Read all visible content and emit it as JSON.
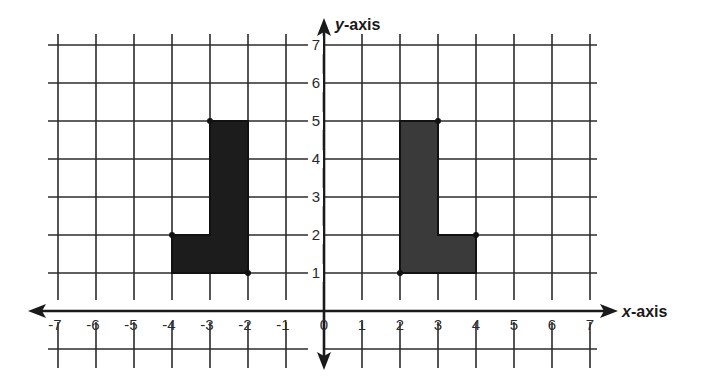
{
  "chart_data": {
    "type": "coordinate-plane",
    "xlabel": "x-axis",
    "ylabel": "y-axis",
    "xlim": [
      -7,
      7
    ],
    "ylim": [
      -1,
      7
    ],
    "grid": true,
    "x_ticks": [
      -7,
      -6,
      -5,
      -4,
      -3,
      -2,
      -1,
      0,
      1,
      2,
      3,
      4,
      5,
      6,
      7
    ],
    "y_ticks": [
      1,
      2,
      3,
      4,
      5,
      6,
      7
    ],
    "shapes": [
      {
        "name": "left-L-shape",
        "fill": "#1c1c1c",
        "vertices": [
          [
            -3,
            5
          ],
          [
            -2,
            5
          ],
          [
            -2,
            1
          ],
          [
            -4,
            1
          ],
          [
            -4,
            2
          ],
          [
            -3,
            2
          ]
        ],
        "marked_points": [
          [
            -3,
            5
          ],
          [
            -4,
            2
          ],
          [
            -2,
            1
          ]
        ]
      },
      {
        "name": "right-L-shape",
        "fill": "#3a3a3a",
        "vertices": [
          [
            2,
            5
          ],
          [
            3,
            5
          ],
          [
            3,
            2
          ],
          [
            4,
            2
          ],
          [
            4,
            1
          ],
          [
            2,
            1
          ]
        ],
        "marked_points": [
          [
            3,
            5
          ],
          [
            4,
            2
          ],
          [
            2,
            1
          ]
        ]
      }
    ]
  },
  "labels": {
    "x_axis": "x-axis",
    "y_axis": "y-axis",
    "x_axis_var": "x",
    "x_axis_suffix": "-axis",
    "y_axis_var": "y",
    "y_axis_suffix": "-axis"
  },
  "colors": {
    "grid": "#2b2b2b",
    "axis": "#1a1a1a",
    "background": "#ffffff"
  }
}
